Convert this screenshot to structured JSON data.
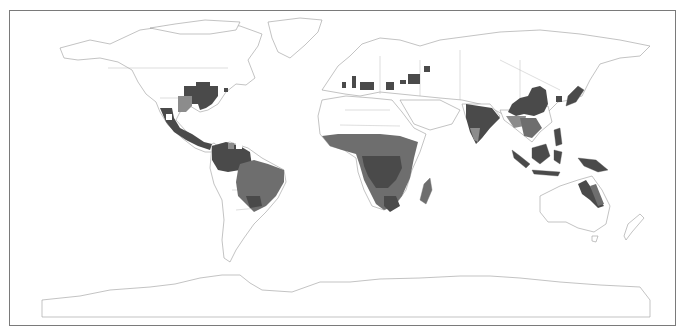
{
  "map": {
    "projection": "equirectangular world map",
    "frame": {
      "left": 9,
      "top": 10,
      "right": 676,
      "bottom": 326,
      "border_color": "#7a7a7a"
    },
    "colors": {
      "land_fill": "#ffffff",
      "coastline": "#9a9a9a",
      "shade_dark": "#4a4a4a",
      "shade_mid": "#6e6e6e",
      "shade_light": "#8c8c8c"
    },
    "shaded_regions": [
      "Eastern United States",
      "Mexico and Central America",
      "Northern South America / Amazon",
      "Brazil",
      "Southern Europe / Mediterranean",
      "Black Sea / Caucasus",
      "Sub-Saharan Africa",
      "Madagascar",
      "India",
      "Southern and Eastern China",
      "Japan",
      "Southeast Asia",
      "Indonesia / Borneo",
      "New Guinea",
      "Northeastern Australia"
    ]
  }
}
